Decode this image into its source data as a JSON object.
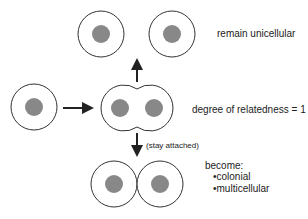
{
  "diagram": {
    "labels": {
      "remain": "remain unicellular",
      "relatedness": "degree of relatedness = 1",
      "stay": "(stay attached)",
      "become": "become:",
      "outcomes": [
        "colonial",
        "multicellular"
      ]
    },
    "colors": {
      "outline": "#333333",
      "nucleus": "#888888",
      "arrow": "#222222"
    }
  }
}
